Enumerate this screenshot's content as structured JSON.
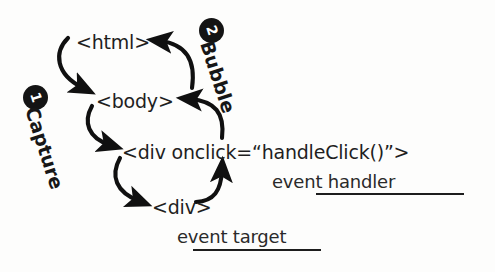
{
  "diagram": {
    "background_color": "#fdfdfc",
    "ink_color": "#1b1b1b",
    "nodes": [
      {
        "id": "html",
        "label": "<html>",
        "x": 76,
        "y": 32
      },
      {
        "id": "body",
        "label": "<body>",
        "x": 96,
        "y": 91
      },
      {
        "id": "div_handler",
        "label": "<div onclick=“handleClick()”>",
        "x": 122,
        "y": 142
      },
      {
        "id": "div_target",
        "label": "<div>",
        "x": 152,
        "y": 197
      }
    ],
    "captions": [
      {
        "id": "event-handler",
        "label": "event handler",
        "x": 272,
        "y": 172,
        "rule_x": 316,
        "rule_y": 193,
        "rule_width": 148
      },
      {
        "id": "event-target",
        "label": "event target",
        "x": 177,
        "y": 227,
        "rule_x": 193,
        "rule_y": 249,
        "rule_width": 128
      }
    ],
    "phases": [
      {
        "id": "capture",
        "label": "Capture",
        "step": "1",
        "badge_x": 23,
        "badge_y": 85,
        "label_x": 42,
        "label_y": 104,
        "rotation_deg": 72
      },
      {
        "id": "bubble",
        "label": "Bubble",
        "step": "2",
        "badge_x": 199,
        "badge_y": 18,
        "label_x": 217,
        "label_y": 38,
        "rotation_deg": 72
      }
    ],
    "arrows": {
      "capture_color": "#101010",
      "bubble_color": "#101010",
      "capture_paths": [
        {
          "id": "capture-html-to-body",
          "from": "html",
          "to": "body"
        },
        {
          "id": "capture-body-to-div-handler",
          "from": "body",
          "to": "div_handler"
        },
        {
          "id": "capture-div-handler-to-div-target",
          "from": "div_handler",
          "to": "div_target"
        }
      ],
      "bubble_paths": [
        {
          "id": "bubble-div-target-to-div-handler",
          "from": "div_target",
          "to": "div_handler"
        },
        {
          "id": "bubble-div-handler-to-body",
          "from": "div_handler",
          "to": "body"
        },
        {
          "id": "bubble-body-to-html",
          "from": "body",
          "to": "html"
        }
      ]
    }
  }
}
